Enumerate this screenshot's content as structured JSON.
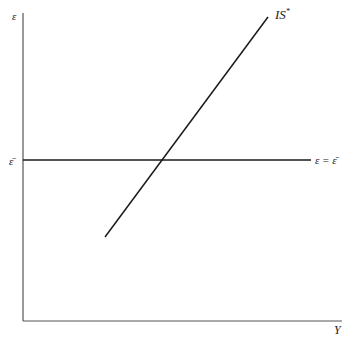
{
  "diagram": {
    "type": "economics-graph",
    "axes": {
      "y_label": "ε",
      "x_label": "Y"
    },
    "curves": [
      {
        "name": "IS*",
        "label": "IS",
        "superscript": "*"
      },
      {
        "name": "horizontal",
        "label": "ε = ε̄"
      }
    ],
    "y_tick_label": "ε̄",
    "colors": {
      "line": "#1a1a1a",
      "axis": "#4a4a4a",
      "background": "#ffffff"
    }
  }
}
